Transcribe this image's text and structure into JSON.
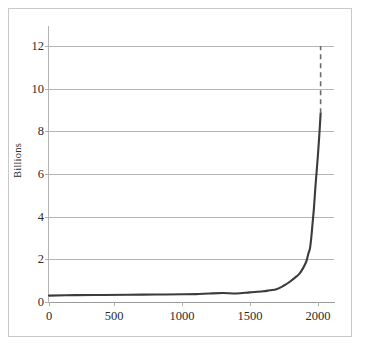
{
  "chart_data": {
    "type": "line",
    "title": "",
    "subtitle": "",
    "xlabel": "",
    "ylabel": "Billions",
    "xlim": [
      0,
      2130
    ],
    "ylim": [
      0,
      12
    ],
    "grid": true,
    "legend": "none",
    "x_ticks": [
      "0",
      "500",
      "1000",
      "1500",
      "2000"
    ],
    "x_tick_values": [
      0,
      500,
      1000,
      1500,
      2000
    ],
    "y_ticks": [
      "0",
      "2",
      "4",
      "6",
      "8",
      "10",
      "12"
    ],
    "y_tick_values": [
      0,
      2,
      4,
      6,
      8,
      10,
      12
    ],
    "series": [
      {
        "name": "World population",
        "style": "solid",
        "color": "#3b3b3b",
        "x": [
          0,
          200,
          400,
          600,
          800,
          1000,
          1100,
          1200,
          1300,
          1400,
          1500,
          1600,
          1650,
          1700,
          1750,
          1800,
          1850,
          1875,
          1900,
          1920,
          1930,
          1940,
          1950,
          1960,
          1970,
          1980,
          1990,
          2000,
          2010,
          2020,
          2030
        ],
        "y": [
          0.3,
          0.32,
          0.33,
          0.34,
          0.35,
          0.36,
          0.37,
          0.4,
          0.42,
          0.4,
          0.45,
          0.5,
          0.55,
          0.6,
          0.75,
          0.95,
          1.2,
          1.35,
          1.6,
          1.85,
          2.05,
          2.3,
          2.5,
          3.0,
          3.7,
          4.4,
          5.3,
          6.1,
          6.9,
          7.8,
          8.85
        ]
      },
      {
        "name": "Projection",
        "style": "dashed",
        "color": "#6b6b6b",
        "x": [
          2030,
          2030
        ],
        "y": [
          8.85,
          12.0
        ]
      }
    ],
    "annotations": []
  },
  "colors": {
    "curve": "#3b3b3b",
    "projection": "#6b6b6b",
    "gridline": "#b5b5b5",
    "axis": "#9a9a9a",
    "frame": "#c8c8c8",
    "text": "#2b2b2b",
    "background": "#ffffff"
  },
  "axis": {
    "y_label": "Billions",
    "y_tick_labels": [
      "12",
      "10",
      "8",
      "6",
      "4",
      "2",
      "0"
    ],
    "x_tick_labels": [
      "0",
      "500",
      "1000",
      "1500",
      "2000"
    ]
  }
}
